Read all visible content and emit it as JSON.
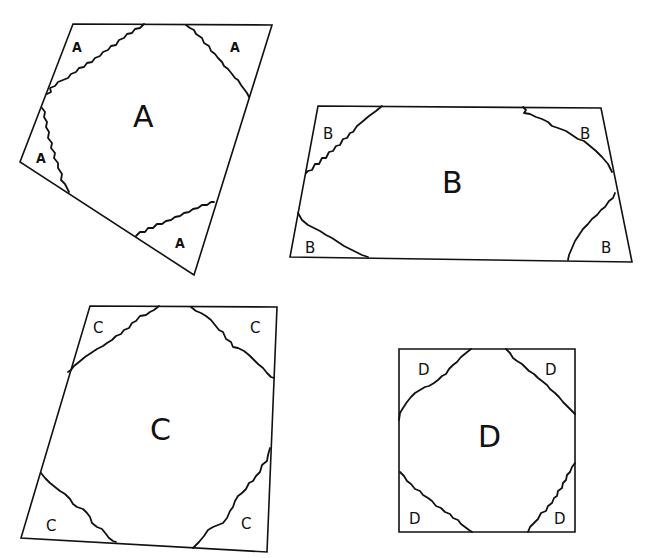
{
  "diagram": {
    "shapes": [
      {
        "id": "A",
        "center_label": "A",
        "corner_labels": [
          "A",
          "A",
          "A",
          "A"
        ],
        "corners": {
          "top_left": "A",
          "top_right": "A",
          "bottom_left": "A",
          "bottom_right": "A"
        }
      },
      {
        "id": "B",
        "center_label": "B",
        "corner_labels": [
          "B",
          "B",
          "B",
          "B"
        ],
        "corners": {
          "top_left": "B",
          "top_right": "B",
          "bottom_left": "B",
          "bottom_right": "B"
        }
      },
      {
        "id": "C",
        "center_label": "C",
        "corner_labels": [
          "C",
          "C",
          "C",
          "C"
        ],
        "corners": {
          "top_left": "C",
          "top_right": "C",
          "bottom_left": "C",
          "bottom_right": "C"
        }
      },
      {
        "id": "D",
        "center_label": "D",
        "corner_labels": [
          "D",
          "D",
          "D",
          "D"
        ],
        "corners": {
          "top_left": "D",
          "top_right": "D",
          "bottom_left": "D",
          "bottom_right": "D"
        }
      }
    ]
  }
}
